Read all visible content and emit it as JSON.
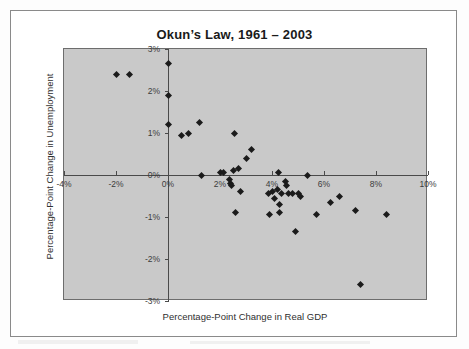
{
  "figure": {
    "title": "Okun’s Law, 1961 – 2003",
    "background_color": "#ffffff",
    "frame_color": "#8a8a8a",
    "plot_background_color": "#c9c9c9",
    "marker_color": "#1b1b1b"
  },
  "chart_data": {
    "type": "scatter",
    "title": "Okun’s Law, 1961 – 2003",
    "xlabel": "Percentage-Point Change in Real GDP",
    "ylabel": "Percentage-Point Change in Unemployment",
    "xlim": [
      -4,
      10
    ],
    "ylim": [
      -3,
      3
    ],
    "grid": false,
    "legend": null,
    "marker": "diamond",
    "x_ticks": [
      -4,
      -2,
      0,
      2,
      4,
      6,
      8,
      10
    ],
    "x_tick_labels": [
      "-4%",
      "-2%",
      "0%",
      "2%",
      "4%",
      "6%",
      "8%",
      "10%"
    ],
    "y_ticks": [
      3,
      2,
      1,
      0,
      -1,
      -2,
      -3
    ],
    "y_tick_labels": [
      "3%",
      "2%",
      "1%",
      "0%",
      "-1%",
      "-2%",
      "-3%"
    ],
    "series": [
      {
        "name": "Annual observations 1961-2003",
        "points": [
          {
            "x": -2.0,
            "y": 2.4
          },
          {
            "x": -1.5,
            "y": 2.4
          },
          {
            "x": 0.0,
            "y": 2.65
          },
          {
            "x": 0.0,
            "y": 1.9
          },
          {
            "x": 0.0,
            "y": 1.2
          },
          {
            "x": 0.5,
            "y": 0.95
          },
          {
            "x": 0.8,
            "y": 1.0
          },
          {
            "x": 1.2,
            "y": 1.25
          },
          {
            "x": 2.55,
            "y": 1.0
          },
          {
            "x": 3.0,
            "y": 0.4
          },
          {
            "x": 2.7,
            "y": 0.15
          },
          {
            "x": 3.2,
            "y": 0.6
          },
          {
            "x": 1.3,
            "y": 0.0
          },
          {
            "x": 2.0,
            "y": 0.05
          },
          {
            "x": 2.15,
            "y": 0.05
          },
          {
            "x": 2.5,
            "y": 0.1
          },
          {
            "x": 2.35,
            "y": -0.1
          },
          {
            "x": 2.4,
            "y": -0.2
          },
          {
            "x": 2.45,
            "y": -0.25
          },
          {
            "x": 4.25,
            "y": 0.05
          },
          {
            "x": 5.35,
            "y": 0.0
          },
          {
            "x": 4.5,
            "y": -0.15
          },
          {
            "x": 4.55,
            "y": -0.25
          },
          {
            "x": 4.2,
            "y": -0.35
          },
          {
            "x": 4.0,
            "y": -0.4
          },
          {
            "x": 3.85,
            "y": -0.45
          },
          {
            "x": 4.35,
            "y": -0.45
          },
          {
            "x": 4.65,
            "y": -0.45
          },
          {
            "x": 4.8,
            "y": -0.45
          },
          {
            "x": 5.0,
            "y": -0.45
          },
          {
            "x": 5.1,
            "y": -0.5
          },
          {
            "x": 2.8,
            "y": -0.4
          },
          {
            "x": 4.1,
            "y": -0.55
          },
          {
            "x": 4.3,
            "y": -0.7
          },
          {
            "x": 6.25,
            "y": -0.65
          },
          {
            "x": 6.6,
            "y": -0.5
          },
          {
            "x": 7.2,
            "y": -0.85
          },
          {
            "x": 2.6,
            "y": -0.9
          },
          {
            "x": 4.3,
            "y": -0.9
          },
          {
            "x": 3.9,
            "y": -0.95
          },
          {
            "x": 5.7,
            "y": -0.95
          },
          {
            "x": 8.4,
            "y": -0.95
          },
          {
            "x": 4.9,
            "y": -1.35
          },
          {
            "x": 7.4,
            "y": -2.6
          }
        ]
      }
    ]
  }
}
